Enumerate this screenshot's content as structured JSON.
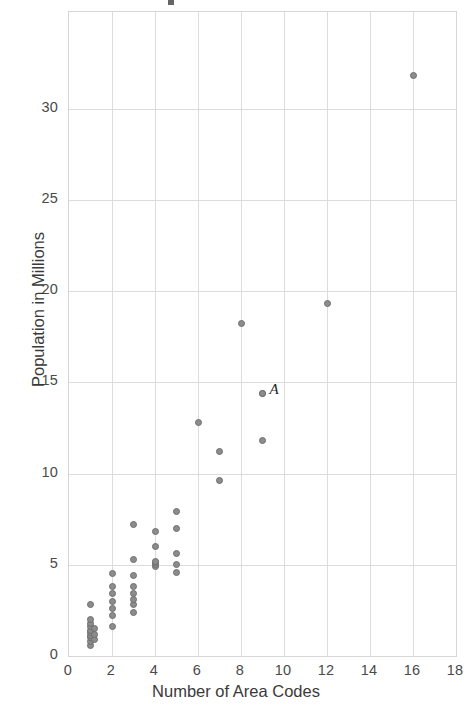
{
  "chart_data": {
    "type": "scatter",
    "title": "",
    "xlabel": "Number of Area Codes",
    "ylabel": "Population in Millions",
    "xlim": [
      0,
      18
    ],
    "ylim": [
      0,
      35.3
    ],
    "xticks": [
      0,
      2,
      4,
      6,
      8,
      10,
      12,
      14,
      16,
      18
    ],
    "yticks": [
      0,
      5,
      10,
      15,
      20,
      25,
      30
    ],
    "xtick_labels": [
      "0",
      "2",
      "4",
      "6",
      "8",
      "10",
      "12",
      "14",
      "16",
      "18"
    ],
    "ytick_labels": [
      "0",
      "5",
      "10",
      "15",
      "20",
      "25",
      "30"
    ],
    "grid": true,
    "legend": "none",
    "marker": {
      "shape": "circle",
      "fill_color": "#8c8c8c",
      "edge_color": "#6e6e6e",
      "size_px": 7
    },
    "annotations": [
      {
        "label": "A",
        "x": 9,
        "y": 14.4
      }
    ],
    "points": [
      {
        "x": 1,
        "y": 0.6
      },
      {
        "x": 1,
        "y": 0.8
      },
      {
        "x": 1,
        "y": 1.0
      },
      {
        "x": 1,
        "y": 1.1
      },
      {
        "x": 1,
        "y": 1.3
      },
      {
        "x": 1,
        "y": 1.4
      },
      {
        "x": 1,
        "y": 1.6
      },
      {
        "x": 1,
        "y": 1.8
      },
      {
        "x": 1,
        "y": 2.0
      },
      {
        "x": 1,
        "y": 2.8
      },
      {
        "x": 1.2,
        "y": 0.9
      },
      {
        "x": 1.2,
        "y": 1.2
      },
      {
        "x": 1.2,
        "y": 1.5
      },
      {
        "x": 2,
        "y": 1.6
      },
      {
        "x": 2,
        "y": 2.2
      },
      {
        "x": 2,
        "y": 2.6
      },
      {
        "x": 2,
        "y": 3.0
      },
      {
        "x": 2,
        "y": 3.4
      },
      {
        "x": 2,
        "y": 3.8
      },
      {
        "x": 2,
        "y": 4.5
      },
      {
        "x": 3,
        "y": 2.4
      },
      {
        "x": 3,
        "y": 2.8
      },
      {
        "x": 3,
        "y": 3.1
      },
      {
        "x": 3,
        "y": 3.4
      },
      {
        "x": 3,
        "y": 3.8
      },
      {
        "x": 3,
        "y": 4.4
      },
      {
        "x": 3,
        "y": 5.3
      },
      {
        "x": 3,
        "y": 7.2
      },
      {
        "x": 4,
        "y": 4.9
      },
      {
        "x": 4,
        "y": 5.0
      },
      {
        "x": 4,
        "y": 5.1
      },
      {
        "x": 4,
        "y": 5.2
      },
      {
        "x": 4,
        "y": 6.0
      },
      {
        "x": 4,
        "y": 6.8
      },
      {
        "x": 5,
        "y": 4.6
      },
      {
        "x": 5,
        "y": 5.0
      },
      {
        "x": 5,
        "y": 5.6
      },
      {
        "x": 5,
        "y": 7.0
      },
      {
        "x": 5,
        "y": 7.9
      },
      {
        "x": 6,
        "y": 12.8
      },
      {
        "x": 7,
        "y": 9.6
      },
      {
        "x": 7,
        "y": 11.2
      },
      {
        "x": 8,
        "y": 18.2
      },
      {
        "x": 9,
        "y": 11.8
      },
      {
        "x": 9,
        "y": 14.4
      },
      {
        "x": 12,
        "y": 19.3
      },
      {
        "x": 16,
        "y": 31.8
      }
    ]
  }
}
